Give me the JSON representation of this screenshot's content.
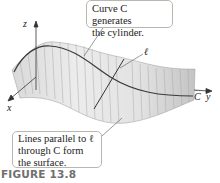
{
  "figure": {
    "caption": "FIGURE 13.8",
    "callouts": [
      {
        "id": "top",
        "line1": "Curve C generates",
        "line2": "the cylinder."
      },
      {
        "id": "bottom",
        "line1": "Lines parallel to ℓ",
        "line2": "through C form",
        "line3": "the surface."
      }
    ],
    "axis_labels": {
      "x": "x",
      "y": "y",
      "z": "z"
    },
    "curve_label": "C",
    "line_label": "ℓ",
    "colors": {
      "surface_light": "#e6e6e6",
      "surface_dark": "#b8b8b8",
      "curve": "#3a3a3a",
      "axis": "#333333",
      "caption": "#6f6f6f"
    }
  }
}
